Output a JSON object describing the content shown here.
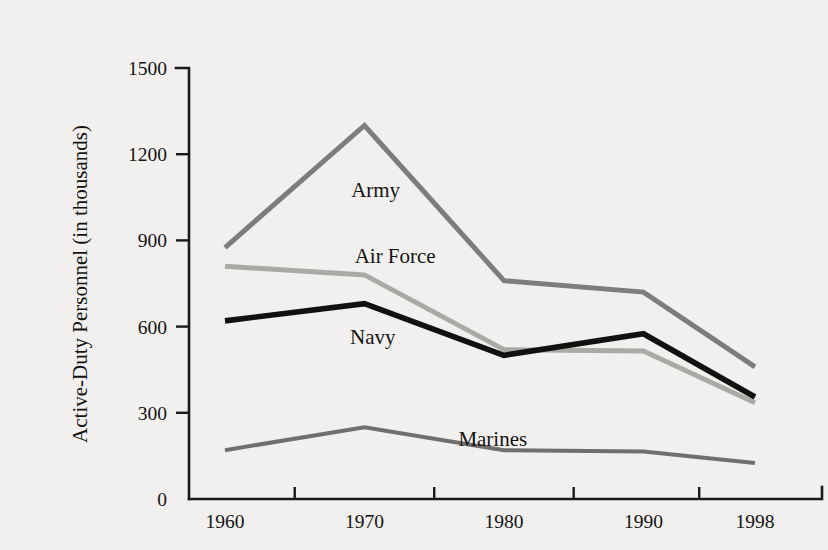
{
  "chart_data": {
    "type": "line",
    "title": "",
    "xlabel": "",
    "ylabel": "Active-Duty Personnel (in thousands)",
    "x": [
      1960,
      1970,
      1980,
      1990,
      1998
    ],
    "categories": [
      "1960",
      "1970",
      "1980",
      "1990",
      "1998"
    ],
    "xtick_labels": [
      "1960",
      "1970",
      "1980",
      "1990",
      "1998"
    ],
    "ytick_labels": [
      "0",
      "300",
      "600",
      "900",
      "1200",
      "1500"
    ],
    "ytick_values": [
      0,
      300,
      600,
      900,
      1200,
      1500
    ],
    "ylim": [
      0,
      1500
    ],
    "xlim": [
      1960,
      1998
    ],
    "grid": false,
    "legend": "inline-labels",
    "series": [
      {
        "name": "Army",
        "label": "Army",
        "color": "#7d7d7b",
        "width": 5.0,
        "values": [
          875,
          1300,
          760,
          720,
          460
        ],
        "label_x": 1970.8,
        "label_y": 1075
      },
      {
        "name": "Air Force",
        "label": "Air Force",
        "color": "#a9a9a6",
        "width": 5.0,
        "values": [
          810,
          780,
          520,
          515,
          335
        ],
        "label_x": 1972.2,
        "label_y": 845
      },
      {
        "name": "Navy",
        "label": "Navy",
        "color": "#111110",
        "width": 5.6,
        "values": [
          620,
          680,
          500,
          575,
          355
        ],
        "label_x": 1970.6,
        "label_y": 565
      },
      {
        "name": "Marines",
        "label": "Marines",
        "color": "#6f6f6d",
        "width": 4.0,
        "values": [
          170,
          250,
          170,
          165,
          125
        ],
        "label_x": 1979.2,
        "label_y": 210
      }
    ]
  },
  "colors": {
    "background": "#f1f0ee",
    "axis": "#1a1a18",
    "text": "#131312",
    "army": "#7d7d7b",
    "air_force": "#a9a9a6",
    "navy": "#111110",
    "marines": "#6f6f6d"
  }
}
